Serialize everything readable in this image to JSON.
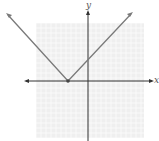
{
  "chart_data": {
    "type": "line",
    "title": "",
    "function": "y = |x + 4|",
    "xlabel": "x",
    "ylabel": "y",
    "xlim": [
      -10,
      11
    ],
    "ylim": [
      -11,
      11
    ],
    "grid": true,
    "series": [
      {
        "name": "left branch",
        "x": [
          -4,
          -11
        ],
        "y": [
          0,
          7
        ],
        "arrow": true
      },
      {
        "name": "right branch",
        "x": [
          -4,
          7
        ],
        "y": [
          0,
          11
        ],
        "arrow": true
      }
    ],
    "points": [
      {
        "x": -4,
        "y": 0,
        "label": "vertex"
      }
    ],
    "colors": {
      "line": "#7a7a7a",
      "grid": "#dcdcdc",
      "axis": "#333333",
      "grid_bg": "#efefef"
    }
  },
  "labels": {
    "x_axis": "x",
    "y_axis": "y"
  }
}
